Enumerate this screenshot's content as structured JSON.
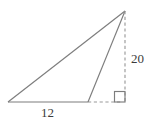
{
  "figure": {
    "background_color": "#ffffff",
    "stroke_color": "#7d7d7d",
    "text_color": "#3b3b3b"
  },
  "labels": {
    "base": "12",
    "height": "20"
  },
  "diagram_data": {
    "type": "geometry",
    "shape": "triangle",
    "description": "Obtuse triangle with a cevian drawn from the apex to the point where the solid base ends; a dashed vertical segment of length 20 drops from the apex to a right angle, and a dashed horizontal segment extends the base to meet it.",
    "vertices": {
      "left": [
        8,
        102
      ],
      "base_right": [
        88,
        102
      ],
      "foot": [
        120,
        102
      ],
      "apex": [
        125,
        11
      ]
    },
    "segments": [
      {
        "name": "base-solid",
        "from": [
          8,
          102
        ],
        "to": [
          88,
          102
        ],
        "style": "solid",
        "label": "12"
      },
      {
        "name": "base-dashed-extension",
        "from": [
          88,
          102
        ],
        "to": [
          120,
          102
        ],
        "style": "dashed"
      },
      {
        "name": "hypotenuse-long",
        "from": [
          8,
          102
        ],
        "to": [
          125,
          11
        ],
        "style": "solid"
      },
      {
        "name": "cevian",
        "from": [
          88,
          102
        ],
        "to": [
          125,
          11
        ],
        "style": "solid"
      },
      {
        "name": "height-dashed",
        "from": [
          125,
          11
        ],
        "to": [
          125,
          102
        ],
        "style": "dashed",
        "label": "20"
      }
    ],
    "right_angle_marker": {
      "x": 114,
      "y": 91,
      "size": 11
    },
    "measurements": [
      {
        "label": "12",
        "segment": "base-solid",
        "position": "below"
      },
      {
        "label": "20",
        "segment": "height-dashed",
        "position": "right"
      }
    ]
  }
}
